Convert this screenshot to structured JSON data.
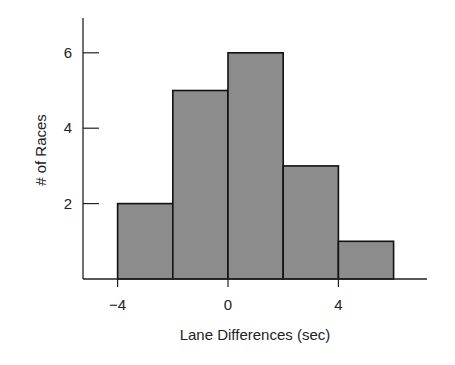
{
  "chart_data": {
    "type": "bar",
    "subtype": "histogram",
    "title": "",
    "xlabel": "Lane Differences (sec)",
    "ylabel": "# of Races",
    "bins": [
      [
        -4,
        -2
      ],
      [
        -2,
        0
      ],
      [
        0,
        2
      ],
      [
        2,
        4
      ],
      [
        4,
        6
      ]
    ],
    "categories": [
      "-4 to -2",
      "-2 to 0",
      "0 to 2",
      "2 to 4",
      "4 to 6"
    ],
    "values": [
      2,
      5,
      6,
      3,
      1
    ],
    "x_ticks": [
      -4,
      0,
      4
    ],
    "x_tick_labels": [
      "−4",
      "0",
      "4"
    ],
    "y_ticks": [
      2,
      4,
      6
    ],
    "y_tick_labels": [
      "2",
      "4",
      "6"
    ],
    "xlim": [
      -7,
      8.1
    ],
    "ylim": [
      0,
      6.6
    ],
    "grid": false,
    "legend": null,
    "bar_color": "#8c8c8c",
    "edge_color": "#111111"
  }
}
